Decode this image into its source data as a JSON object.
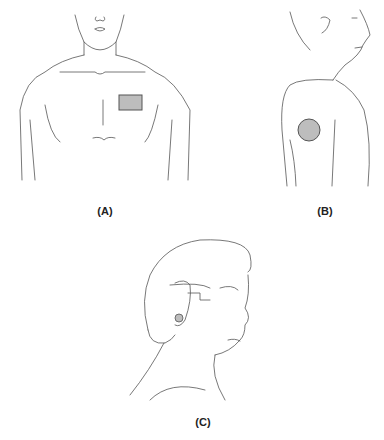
{
  "figure": {
    "panels": [
      {
        "id": "A",
        "label": "(A)",
        "view": "front chest",
        "marker_shape": "rectangle",
        "marker_location": "upper left chest"
      },
      {
        "id": "B",
        "label": "(B)",
        "view": "side upper arm",
        "marker_shape": "circle",
        "marker_location": "upper arm"
      },
      {
        "id": "C",
        "label": "(C)",
        "view": "side head",
        "marker_shape": "small circle",
        "marker_location": "behind ear"
      }
    ],
    "colors": {
      "line": "#555555",
      "marker_fill": "#bdbdbd",
      "marker_stroke": "#555555"
    }
  }
}
